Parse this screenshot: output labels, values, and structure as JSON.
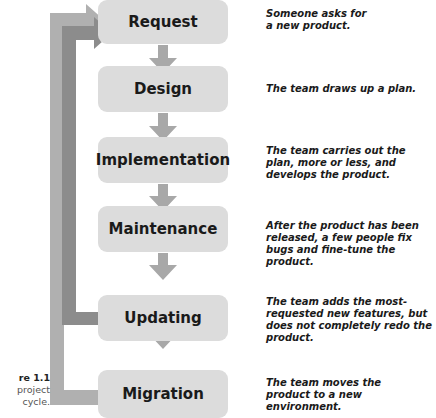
{
  "diagram": {
    "type": "flowchart-cycle",
    "steps": [
      {
        "label": "Request",
        "description": "Someone asks for a new product."
      },
      {
        "label": "Design",
        "description": "The team draws up a plan."
      },
      {
        "label": "Implementation",
        "description": "The team carries out the plan, more or less, and develops the product."
      },
      {
        "label": "Maintenance",
        "description": "After the product has been released, a few people fix bugs and fine-tune the product."
      },
      {
        "label": "Updating",
        "description": "The team adds the most-requested new features, but does not completely redo the product."
      },
      {
        "label": "Migration",
        "description": "The team moves the product to a new environment."
      }
    ],
    "loops": [
      {
        "from": "Updating",
        "to": "Request"
      },
      {
        "from": "Migration",
        "to": "Request"
      }
    ],
    "colors": {
      "box": "#dcdcdc",
      "arrow": "#a8a8a8",
      "loop_inner": "#8c8c8c",
      "loop_outer": "#b0b0b0"
    }
  },
  "caption": {
    "figure": "re 1.1",
    "line1": "project",
    "line2": "cycle."
  }
}
